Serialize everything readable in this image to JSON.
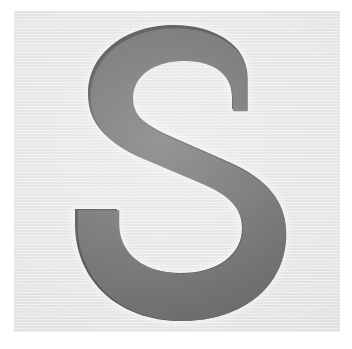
{
  "image": {
    "kind": "scanned-letterform",
    "width": 352,
    "height": 349,
    "caption": "S",
    "outer_background_color": "#ffffff"
  },
  "panel": {
    "name": "letter-swatch-panel",
    "x": 14,
    "y": 11,
    "width": 326,
    "height": 321,
    "background_color": "#e4e4e4",
    "texture": "fine horizontal scan lines"
  },
  "glyph": {
    "character": "S",
    "case": "uppercase",
    "style": "sans-serif, bold, flat vertical terminals",
    "fill_color": "#6a6a6a",
    "edge_color": "#4a4a4a",
    "halo_color": "#f5f5f5",
    "counter_color": "#eeeeee",
    "bbox": {
      "x": 61,
      "y": 14,
      "width": 192,
      "height": 296
    },
    "notes": "thick diagonal spine, flat cut terminal upper-right and lower-left, light halo from scan"
  }
}
